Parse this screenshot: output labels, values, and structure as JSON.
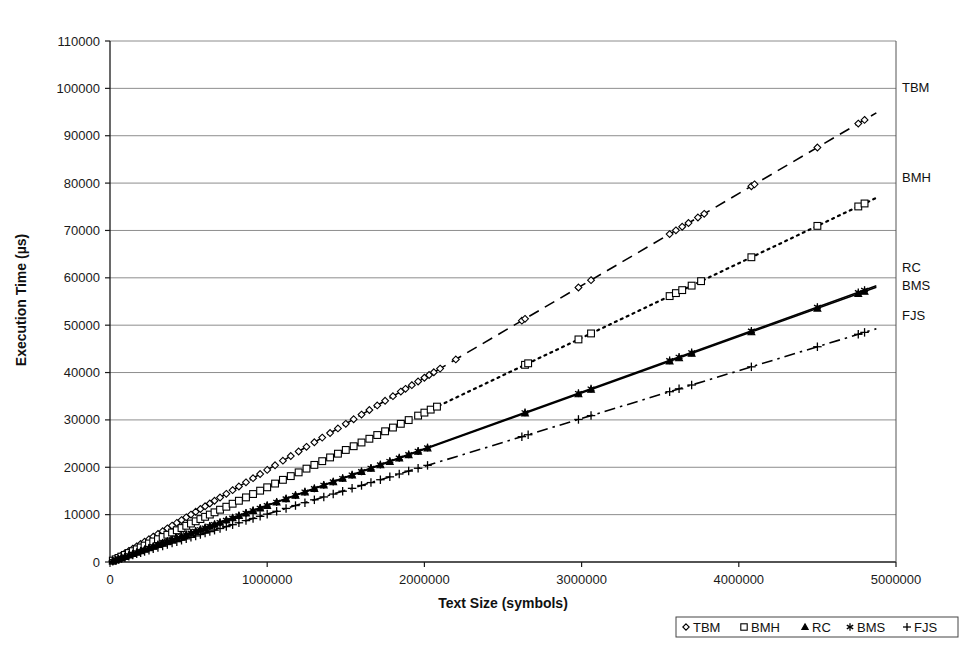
{
  "chart_data": {
    "type": "scatter",
    "title": "",
    "xlabel": "Text Size (symbols)",
    "ylabel": "Execution Time (µs)",
    "xlim": [
      0,
      5000000
    ],
    "ylim": [
      0,
      110000
    ],
    "grid": true,
    "xticks": [
      0,
      1000000,
      2000000,
      3000000,
      4000000,
      5000000
    ],
    "xtick_labels": [
      "0",
      "1000000",
      "2000000",
      "3000000",
      "4000000",
      "5000000"
    ],
    "yticks": [
      0,
      10000,
      20000,
      30000,
      40000,
      50000,
      60000,
      70000,
      80000,
      90000,
      100000,
      110000
    ],
    "ytick_labels": [
      "0",
      "10000",
      "20000",
      "30000",
      "40000",
      "50000",
      "60000",
      "70000",
      "80000",
      "90000",
      "100000",
      "110000"
    ],
    "legend_position": "bottom-right",
    "series": [
      {
        "name": "TBM",
        "marker": "diamond",
        "line_style": "dashed",
        "slope_per_symbol": 0.01945,
        "right_label": "TBM",
        "x": [
          18000,
          36000,
          54000,
          72000,
          95000,
          120000,
          145000,
          170000,
          195000,
          220000,
          248000,
          275000,
          305000,
          335000,
          365000,
          395000,
          425000,
          455000,
          485000,
          515000,
          545000,
          575000,
          605000,
          635000,
          665000,
          700000,
          740000,
          780000,
          820000,
          865000,
          910000,
          955000,
          1000000,
          1050000,
          1100000,
          1150000,
          1200000,
          1250000,
          1300000,
          1350000,
          1400000,
          1450000,
          1500000,
          1550000,
          1600000,
          1650000,
          1700000,
          1750000,
          1800000,
          1850000,
          1880000,
          1920000,
          1960000,
          2000000,
          2030000,
          2060000,
          2100000,
          2200000,
          2620000,
          2640000,
          2980000,
          3060000,
          3560000,
          3600000,
          3640000,
          3680000,
          3740000,
          3780000,
          4080000,
          4100000,
          4500000,
          4760000,
          4800000
        ],
        "y": [
          350,
          700,
          1050,
          1400,
          1850,
          2330,
          2820,
          3300,
          3790,
          4280,
          4820,
          5350,
          5930,
          6510,
          7100,
          7680,
          8260,
          8850,
          9430,
          10010,
          10600,
          11180,
          11760,
          12350,
          12930,
          13610,
          14390,
          15170,
          15950,
          16820,
          17700,
          18570,
          19450,
          20420,
          21390,
          22370,
          23340,
          24310,
          25280,
          26260,
          27230,
          28200,
          29170,
          30150,
          31120,
          32090,
          33060,
          34040,
          35010,
          35980,
          36560,
          37340,
          38120,
          38900,
          39480,
          40060,
          40830,
          42770,
          50950,
          51340,
          57960,
          59510,
          69240,
          70020,
          70790,
          71570,
          72740,
          73510,
          79340,
          79730,
          87510,
          92560,
          93340
        ]
      },
      {
        "name": "BMH",
        "marker": "square",
        "line_style": "dotted",
        "slope_per_symbol": 0.01577,
        "right_label": "BMH",
        "x": [
          18000,
          36000,
          54000,
          72000,
          95000,
          120000,
          145000,
          170000,
          195000,
          220000,
          248000,
          275000,
          305000,
          335000,
          365000,
          395000,
          425000,
          455000,
          485000,
          515000,
          545000,
          575000,
          605000,
          635000,
          665000,
          700000,
          740000,
          780000,
          820000,
          865000,
          910000,
          955000,
          1000000,
          1050000,
          1100000,
          1150000,
          1200000,
          1250000,
          1300000,
          1350000,
          1400000,
          1450000,
          1500000,
          1550000,
          1600000,
          1650000,
          1700000,
          1750000,
          1800000,
          1850000,
          1900000,
          1960000,
          2000000,
          2040000,
          2080000,
          2640000,
          2660000,
          2980000,
          3060000,
          3560000,
          3600000,
          3640000,
          3700000,
          3760000,
          4080000,
          4500000,
          4760000,
          4800000
        ],
        "y": [
          284,
          568,
          852,
          1135,
          1498,
          1892,
          2287,
          2681,
          3075,
          3469,
          3911,
          4337,
          4810,
          5283,
          5756,
          6229,
          6702,
          7175,
          7648,
          8121,
          8594,
          9068,
          9541,
          10014,
          10487,
          11039,
          11670,
          12301,
          12931,
          13641,
          14351,
          15060,
          15770,
          16559,
          17347,
          18136,
          18924,
          19713,
          20501,
          21290,
          22078,
          22867,
          23655,
          24444,
          25232,
          26021,
          26809,
          27598,
          28386,
          29175,
          29963,
          30909,
          31540,
          32171,
          32803,
          41633,
          41948,
          46995,
          48256,
          56141,
          56772,
          57403,
          58350,
          59296,
          64342,
          70965,
          75066,
          75696
        ]
      },
      {
        "name": "RC",
        "marker": "triangle",
        "line_style": "solid",
        "slope_per_symbol": 0.0119,
        "right_label": "RC",
        "x": [
          18000,
          36000,
          54000,
          72000,
          95000,
          120000,
          145000,
          170000,
          195000,
          220000,
          248000,
          275000,
          305000,
          335000,
          365000,
          395000,
          425000,
          455000,
          485000,
          515000,
          545000,
          575000,
          605000,
          635000,
          665000,
          700000,
          740000,
          780000,
          820000,
          865000,
          910000,
          955000,
          1000000,
          1060000,
          1120000,
          1180000,
          1240000,
          1300000,
          1360000,
          1420000,
          1480000,
          1540000,
          1600000,
          1660000,
          1720000,
          1780000,
          1840000,
          1900000,
          1960000,
          2020000,
          2640000,
          2980000,
          3060000,
          3560000,
          3620000,
          3700000,
          4080000,
          4500000,
          4760000,
          4800000
        ],
        "y": [
          214,
          428,
          643,
          857,
          1131,
          1428,
          1726,
          2023,
          2321,
          2618,
          2951,
          3273,
          3630,
          3987,
          4344,
          4701,
          5058,
          5415,
          5772,
          6129,
          6486,
          6843,
          7200,
          7557,
          7914,
          8330,
          8806,
          9282,
          9758,
          10294,
          10829,
          11365,
          11900,
          12614,
          13328,
          14042,
          14756,
          15470,
          16184,
          16898,
          17612,
          18326,
          19040,
          19754,
          20468,
          21182,
          21896,
          22610,
          23324,
          24038,
          31416,
          35462,
          36414,
          42364,
          43078,
          44030,
          48552,
          53550,
          56644,
          57120
        ]
      },
      {
        "name": "BMS",
        "marker": "star",
        "line_style": "solid",
        "slope_per_symbol": 0.01196,
        "right_label": "BMS",
        "x": [
          18000,
          36000,
          54000,
          72000,
          95000,
          120000,
          145000,
          170000,
          195000,
          220000,
          248000,
          275000,
          305000,
          335000,
          365000,
          395000,
          425000,
          455000,
          485000,
          515000,
          545000,
          575000,
          605000,
          635000,
          665000,
          700000,
          740000,
          780000,
          820000,
          865000,
          910000,
          955000,
          1000000,
          1060000,
          1120000,
          1180000,
          1240000,
          1300000,
          1360000,
          1420000,
          1480000,
          1540000,
          1600000,
          1660000,
          1720000,
          1780000,
          1840000,
          1900000,
          1960000,
          2020000,
          2640000,
          2980000,
          3060000,
          3560000,
          3620000,
          3700000,
          4080000,
          4500000,
          4760000,
          4800000
        ],
        "y": [
          215,
          431,
          646,
          861,
          1136,
          1435,
          1734,
          2033,
          2332,
          2631,
          2966,
          3289,
          3648,
          4007,
          4365,
          4724,
          5083,
          5442,
          5801,
          6160,
          6518,
          6877,
          7236,
          7595,
          7954,
          8372,
          8850,
          9329,
          9807,
          10345,
          10884,
          11422,
          11960,
          12678,
          13395,
          14113,
          14830,
          15548,
          16266,
          16983,
          17701,
          18418,
          19136,
          19854,
          20571,
          21289,
          22006,
          22724,
          23442,
          24159,
          31574,
          35641,
          36598,
          42578,
          43295,
          44252,
          48797,
          53820,
          56930,
          57408
        ]
      },
      {
        "name": "FJS",
        "marker": "plus",
        "line_style": "dashdot",
        "slope_per_symbol": 0.0101,
        "right_label": "FJS",
        "x": [
          18000,
          36000,
          54000,
          72000,
          95000,
          120000,
          145000,
          170000,
          195000,
          220000,
          248000,
          275000,
          305000,
          335000,
          365000,
          395000,
          425000,
          455000,
          485000,
          515000,
          545000,
          575000,
          605000,
          635000,
          665000,
          700000,
          740000,
          780000,
          820000,
          865000,
          910000,
          955000,
          1000000,
          1060000,
          1120000,
          1180000,
          1240000,
          1300000,
          1360000,
          1420000,
          1480000,
          1540000,
          1600000,
          1660000,
          1720000,
          1780000,
          1840000,
          1900000,
          1960000,
          2020000,
          2620000,
          2660000,
          2980000,
          3060000,
          3560000,
          3620000,
          3700000,
          4080000,
          4500000,
          4760000,
          4800000
        ],
        "y": [
          182,
          364,
          545,
          727,
          960,
          1212,
          1465,
          1717,
          1970,
          2222,
          2505,
          2778,
          3081,
          3384,
          3687,
          3990,
          4293,
          4596,
          4899,
          5202,
          5505,
          5808,
          6111,
          6414,
          6717,
          7070,
          7474,
          7878,
          8282,
          8737,
          9191,
          9646,
          10100,
          10706,
          11312,
          11918,
          12524,
          13130,
          13736,
          14342,
          14948,
          15554,
          16160,
          16766,
          17372,
          17978,
          18584,
          19190,
          19796,
          20402,
          26462,
          26866,
          30098,
          30906,
          35956,
          36562,
          37370,
          41208,
          45450,
          48076,
          48480
        ]
      }
    ]
  },
  "legend": {
    "entries": [
      {
        "marker": "diamond",
        "label": "TBM"
      },
      {
        "marker": "square",
        "label": "BMH"
      },
      {
        "marker": "triangle",
        "label": "RC"
      },
      {
        "marker": "star",
        "label": "BMS"
      },
      {
        "marker": "plus",
        "label": "FJS"
      }
    ]
  },
  "colors": {
    "ink": "#000000",
    "grid": "#808080",
    "background": "#ffffff"
  }
}
